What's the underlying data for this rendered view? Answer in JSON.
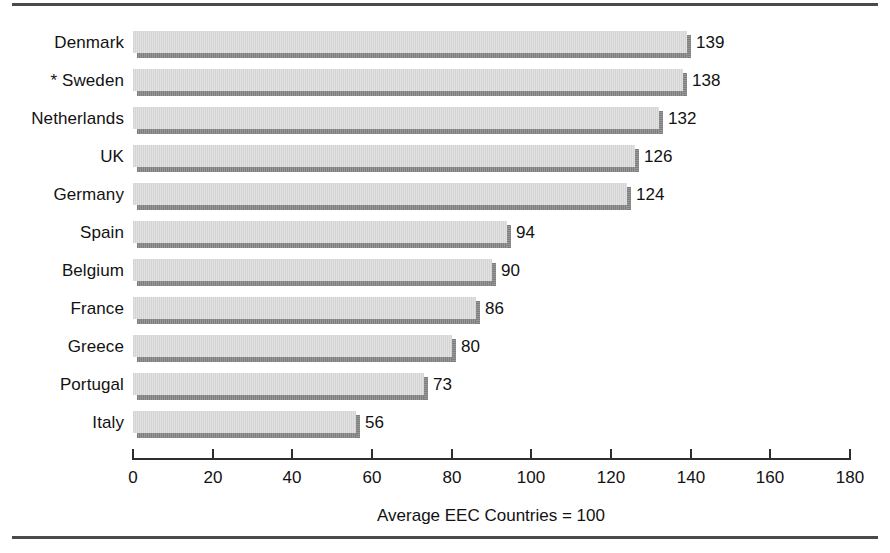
{
  "figure": {
    "width": 890,
    "height": 553,
    "background": "#ffffff",
    "rule_color": "#4a4a4a",
    "bar_fill": "#dcdcdc",
    "bar_shadow": "#888888",
    "axis_color": "#2e2e2e",
    "text_color": "#121212"
  },
  "chart_data": {
    "type": "bar",
    "orientation": "horizontal",
    "title": "",
    "subtitle": "",
    "xlabel": "Average EEC Countries = 100",
    "ylabel": "",
    "categories": [
      "Denmark",
      "* Sweden",
      "Netherlands",
      "UK",
      "Germany",
      "Spain",
      "Belgium",
      "France",
      "Greece",
      "Portugal",
      "Italy"
    ],
    "values": [
      139,
      138,
      132,
      126,
      124,
      94,
      90,
      86,
      80,
      73,
      56
    ],
    "value_labels": [
      "139",
      "138",
      "132",
      "126",
      "124",
      "94",
      "90",
      "86",
      "80",
      "73",
      "56"
    ],
    "xlim": [
      0,
      180
    ],
    "xticks": [
      0,
      20,
      40,
      60,
      80,
      100,
      120,
      140,
      160,
      180
    ],
    "xtick_labels": [
      "0",
      "20",
      "40",
      "60",
      "80",
      "100",
      "120",
      "140",
      "160",
      "180"
    ],
    "grid": false,
    "legend": null,
    "annotations": [
      "* denotes Sweden, marked with an asterisk in the category label"
    ],
    "reference_value": 100
  }
}
